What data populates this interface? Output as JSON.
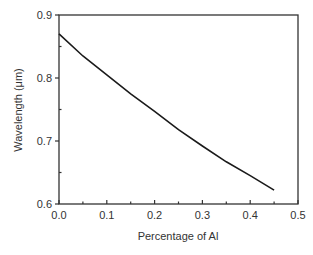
{
  "chart_data": {
    "type": "line",
    "title": "",
    "xlabel": "Percentage of Al",
    "ylabel": "Wavelength (μm)",
    "xlim": [
      0.0,
      0.5
    ],
    "ylim": [
      0.6,
      0.9
    ],
    "x_ticks": [
      "0.0",
      "0.1",
      "0.2",
      "0.3",
      "0.4",
      "0.5"
    ],
    "y_ticks": [
      "0.6",
      "0.7",
      "0.8",
      "0.9"
    ],
    "grid": false,
    "legend": null,
    "series": [
      {
        "name": "Wavelength vs Al fraction",
        "x": [
          0.0,
          0.05,
          0.1,
          0.15,
          0.2,
          0.25,
          0.3,
          0.35,
          0.4,
          0.45
        ],
        "y": [
          0.87,
          0.835,
          0.805,
          0.775,
          0.747,
          0.718,
          0.692,
          0.667,
          0.645,
          0.622
        ]
      }
    ]
  },
  "colors": {
    "line": "#1a1a1a",
    "axis": "#333333"
  }
}
